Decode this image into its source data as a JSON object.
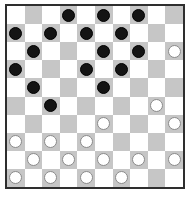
{
  "board": {
    "size": 10,
    "colors": {
      "dark_square": "#c6c6c6",
      "light_square": "#ffffff",
      "black_piece": "#141414",
      "white_piece": "#ffffff",
      "border": "#2e2e2e"
    },
    "dark_square_parity": "row0_odd_columns",
    "pieces": {
      "black": [
        [
          0,
          3
        ],
        [
          0,
          5
        ],
        [
          0,
          7
        ],
        [
          1,
          0
        ],
        [
          1,
          2
        ],
        [
          1,
          4
        ],
        [
          1,
          6
        ],
        [
          2,
          1
        ],
        [
          2,
          5
        ],
        [
          2,
          7
        ],
        [
          3,
          0
        ],
        [
          3,
          4
        ],
        [
          3,
          6
        ],
        [
          4,
          1
        ],
        [
          4,
          5
        ],
        [
          5,
          2
        ]
      ],
      "white": [
        [
          2,
          9
        ],
        [
          5,
          8
        ],
        [
          6,
          5
        ],
        [
          6,
          9
        ],
        [
          7,
          0
        ],
        [
          7,
          2
        ],
        [
          7,
          4
        ],
        [
          8,
          1
        ],
        [
          8,
          3
        ],
        [
          8,
          5
        ],
        [
          8,
          7
        ],
        [
          8,
          9
        ],
        [
          9,
          0
        ],
        [
          9,
          2
        ],
        [
          9,
          4
        ],
        [
          9,
          6
        ]
      ]
    },
    "piece_counts": {
      "black": 16,
      "white": 16
    }
  }
}
